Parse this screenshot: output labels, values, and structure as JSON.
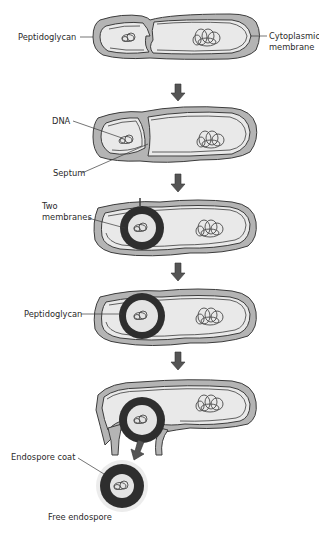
{
  "diagram": {
    "type": "endospore-formation-stages",
    "colors": {
      "cell_wall": "#b4b4b4",
      "cytoplasm": "#e9e9e9",
      "outline": "#3c3c3c",
      "endospore_coat": "#2e2e2e",
      "arrow": "#555555",
      "halo": "#e8e8e8"
    },
    "stages": [
      {
        "step": 1,
        "labels": {
          "left": "Peptidoglycan",
          "right_line1": "Cytoplasmic",
          "right_line2": "membrane"
        }
      },
      {
        "step": 2,
        "labels": {
          "dna": "DNA",
          "septum": "Septum"
        }
      },
      {
        "step": 3,
        "labels": {
          "line1": "Two",
          "line2": "membranes"
        }
      },
      {
        "step": 4,
        "labels": {
          "left": "Peptidoglycan"
        }
      },
      {
        "step": 5,
        "labels": {
          "coat": "Endospore coat",
          "free": "Free endospore"
        }
      }
    ],
    "arrows": [
      "down-arrow",
      "down-arrow",
      "down-arrow",
      "down-arrow",
      "down-left-arrow"
    ]
  }
}
